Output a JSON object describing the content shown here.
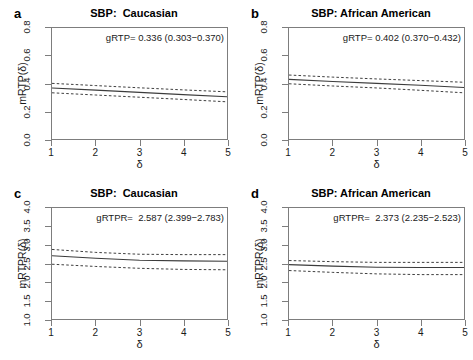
{
  "figure": {
    "background": "#ffffff",
    "line_color": "#3c3c3c",
    "axis_color": "#7d7d7d"
  },
  "panels": [
    {
      "letter": "a",
      "title": "SBP:  Caucasian",
      "annotation": "gRTP= 0.336 (0.303−0.370)",
      "xlabel": "δ",
      "ylabel": "mRTP(δ)"
    },
    {
      "letter": "b",
      "title": "SBP: African American",
      "annotation": "gRTP= 0.402 (0.370−0.432)",
      "xlabel": "δ",
      "ylabel": "mRTP(δ)"
    },
    {
      "letter": "c",
      "title": "SBP:  Caucasian",
      "annotation": "gRTPR=  2.587 (2.399−2.783)",
      "xlabel": "δ",
      "ylabel": "mRTPR(δ)"
    },
    {
      "letter": "d",
      "title": "SBP: African American",
      "annotation": "gRTPR=  2.373 (2.235−2.523)",
      "xlabel": "δ",
      "ylabel": "mRTPR(δ)"
    }
  ],
  "chart_data": [
    {
      "type": "line",
      "panel": "a",
      "title": "SBP:  Caucasian",
      "xlabel": "δ",
      "ylabel": "mRTP(δ)",
      "xlim": [
        1,
        5
      ],
      "ylim": [
        0.0,
        0.8
      ],
      "xticks": [
        1,
        2,
        3,
        4,
        5
      ],
      "yticks": [
        0.0,
        0.2,
        0.4,
        0.6,
        0.8
      ],
      "grid": false,
      "legend": "none",
      "annotation": "gRTP= 0.336 (0.303−0.370)",
      "global_estimate": 0.336,
      "global_ci": [
        0.303,
        0.37
      ],
      "x": [
        1,
        2,
        3,
        4,
        5
      ],
      "series": [
        {
          "name": "mRTP estimate",
          "style": "solid",
          "values": [
            0.368,
            0.352,
            0.336,
            0.32,
            0.304
          ]
        },
        {
          "name": "upper 95% CI",
          "style": "dashed",
          "values": [
            0.401,
            0.385,
            0.369,
            0.354,
            0.34
          ]
        },
        {
          "name": "lower 95% CI",
          "style": "dashed",
          "values": [
            0.333,
            0.317,
            0.301,
            0.285,
            0.268
          ]
        }
      ]
    },
    {
      "type": "line",
      "panel": "b",
      "title": "SBP: African American",
      "xlabel": "δ",
      "ylabel": "mRTP(δ)",
      "xlim": [
        1,
        5
      ],
      "ylim": [
        0.0,
        0.8
      ],
      "xticks": [
        1,
        2,
        3,
        4,
        5
      ],
      "yticks": [
        0.0,
        0.2,
        0.4,
        0.6,
        0.8
      ],
      "grid": false,
      "legend": "none",
      "annotation": "gRTP= 0.402 (0.370−0.432)",
      "global_estimate": 0.402,
      "global_ci": [
        0.37,
        0.432
      ],
      "x": [
        1,
        2,
        3,
        4,
        5
      ],
      "series": [
        {
          "name": "mRTP estimate",
          "style": "solid",
          "values": [
            0.43,
            0.414,
            0.401,
            0.387,
            0.371
          ]
        },
        {
          "name": "upper 95% CI",
          "style": "dashed",
          "values": [
            0.461,
            0.446,
            0.433,
            0.421,
            0.409
          ]
        },
        {
          "name": "lower 95% CI",
          "style": "dashed",
          "values": [
            0.398,
            0.382,
            0.368,
            0.351,
            0.333
          ]
        }
      ]
    },
    {
      "type": "line",
      "panel": "c",
      "title": "SBP:  Caucasian",
      "xlabel": "δ",
      "ylabel": "mRTPR(δ)",
      "xlim": [
        1,
        5
      ],
      "ylim": [
        1.0,
        4.0
      ],
      "xticks": [
        1,
        2,
        3,
        4,
        5
      ],
      "yticks": [
        1.0,
        1.5,
        2.0,
        2.5,
        3.0,
        3.5,
        4.0
      ],
      "grid": false,
      "legend": "none",
      "annotation": "gRTPR=  2.587 (2.399−2.783)",
      "global_estimate": 2.587,
      "global_ci": [
        2.399,
        2.783
      ],
      "x": [
        1,
        2,
        3,
        4,
        5
      ],
      "series": [
        {
          "name": "mRTPR estimate",
          "style": "solid",
          "values": [
            2.71,
            2.64,
            2.59,
            2.57,
            2.56
          ]
        },
        {
          "name": "upper 95% CI",
          "style": "dashed",
          "values": [
            2.88,
            2.8,
            2.75,
            2.74,
            2.74
          ]
        },
        {
          "name": "lower 95% CI",
          "style": "dashed",
          "values": [
            2.48,
            2.42,
            2.37,
            2.34,
            2.33
          ]
        }
      ]
    },
    {
      "type": "line",
      "panel": "d",
      "title": "SBP: African American",
      "xlabel": "δ",
      "ylabel": "mRTPR(δ)",
      "xlim": [
        1,
        5
      ],
      "ylim": [
        1.0,
        4.0
      ],
      "xticks": [
        1,
        2,
        3,
        4,
        5
      ],
      "yticks": [
        1.0,
        1.5,
        2.0,
        2.5,
        3.0,
        3.5,
        4.0
      ],
      "grid": false,
      "legend": "none",
      "annotation": "gRTPR=  2.373 (2.235−2.523)",
      "global_estimate": 2.373,
      "global_ci": [
        2.235,
        2.523
      ],
      "x": [
        1,
        2,
        3,
        4,
        5
      ],
      "series": [
        {
          "name": "mRTPR estimate",
          "style": "solid",
          "values": [
            2.47,
            2.43,
            2.4,
            2.39,
            2.39
          ]
        },
        {
          "name": "upper 95% CI",
          "style": "dashed",
          "values": [
            2.58,
            2.55,
            2.53,
            2.53,
            2.53
          ]
        },
        {
          "name": "lower 95% CI",
          "style": "dashed",
          "values": [
            2.31,
            2.26,
            2.22,
            2.2,
            2.2
          ]
        }
      ]
    }
  ]
}
